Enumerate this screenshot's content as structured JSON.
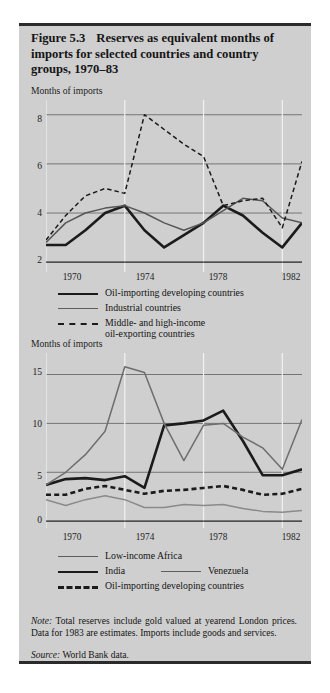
{
  "figure": {
    "number": "Figure 5.3",
    "title": "Reserves as equivalent months of imports for selected countries and country groups, 1970–83",
    "note_label": "Note:",
    "note_text": " Total reserves include gold valued at yearend London prices. Data for 1983 are estimates. Imports include goods and services.",
    "source_label": "Source:",
    "source_text": " World Bank data."
  },
  "chart_data": [
    {
      "id": "panel-top",
      "type": "line",
      "title": "",
      "ylabel": "Months of imports",
      "xlabel": "",
      "x": [
        1970,
        1971,
        1972,
        1973,
        1974,
        1975,
        1976,
        1977,
        1978,
        1979,
        1980,
        1981,
        1982,
        1983
      ],
      "xlim": [
        1970,
        1983
      ],
      "ylim": [
        1.6,
        8.6
      ],
      "yticks": [
        2,
        4,
        6,
        8
      ],
      "ytick_labels": [
        "2",
        "4",
        "6",
        "8"
      ],
      "xticks": [
        1970,
        1974,
        1978,
        1982
      ],
      "xtick_labels": [
        "1970",
        "1974",
        "1978",
        "1982"
      ],
      "grid": "both",
      "legend_position": "below",
      "series": [
        {
          "name": "Oil-importing developing countries",
          "style": "solid",
          "width": "thick",
          "color": "#1b1b1b",
          "values": [
            2.7,
            2.7,
            3.3,
            4.0,
            4.3,
            3.3,
            2.6,
            3.1,
            3.6,
            4.3,
            3.9,
            3.2,
            2.6,
            3.6
          ]
        },
        {
          "name": "Industrial countries",
          "style": "solid",
          "width": "thin",
          "color": "#565656",
          "values": [
            2.8,
            3.6,
            4.0,
            4.2,
            4.3,
            4.0,
            3.6,
            3.3,
            3.6,
            4.1,
            4.6,
            4.5,
            3.8,
            3.6
          ]
        },
        {
          "name": "Middle- and high-income oil-exporting countries",
          "style": "dashed",
          "width": "thin",
          "color": "#1b1b1b",
          "values": [
            2.9,
            3.9,
            4.7,
            5.0,
            4.8,
            8.0,
            7.4,
            6.8,
            6.3,
            4.3,
            4.5,
            4.6,
            3.4,
            6.1
          ]
        }
      ]
    },
    {
      "id": "panel-bottom",
      "type": "line",
      "title": "",
      "ylabel": "Months of imports",
      "xlabel": "",
      "x": [
        1970,
        1971,
        1972,
        1973,
        1974,
        1975,
        1976,
        1977,
        1978,
        1979,
        1980,
        1981,
        1982,
        1983
      ],
      "xlim": [
        1970,
        1983
      ],
      "ylim": [
        -0.7,
        17.2
      ],
      "yticks": [
        0,
        5,
        10,
        15
      ],
      "ytick_labels": [
        "0",
        "5",
        "10",
        "15"
      ],
      "xticks": [
        1970,
        1974,
        1978,
        1982
      ],
      "xtick_labels": [
        "1970",
        "1974",
        "1978",
        "1982"
      ],
      "grid": "both",
      "legend_position": "below",
      "series": [
        {
          "name": "Low-income Africa",
          "style": "solid",
          "width": "thin",
          "color": "#8a8a8a",
          "values": [
            2.2,
            1.6,
            2.2,
            2.6,
            2.2,
            1.4,
            1.4,
            1.7,
            1.6,
            1.7,
            1.3,
            1.0,
            0.9,
            1.1
          ]
        },
        {
          "name": "India",
          "style": "solid",
          "width": "thick",
          "color": "#1b1b1b",
          "values": [
            3.7,
            4.3,
            4.4,
            4.2,
            4.6,
            3.4,
            9.8,
            10.0,
            10.3,
            11.3,
            8.2,
            4.7,
            4.7,
            5.3
          ]
        },
        {
          "name": "Venezuela",
          "style": "solid",
          "width": "thin",
          "color": "#6e6e6e",
          "values": [
            3.7,
            5.0,
            6.8,
            9.2,
            15.8,
            15.2,
            10.0,
            6.2,
            9.8,
            10.0,
            8.6,
            7.5,
            5.3,
            10.4
          ]
        },
        {
          "name": "Oil-importing developing countries",
          "style": "dashed",
          "width": "thick",
          "color": "#1b1b1b",
          "values": [
            2.7,
            2.7,
            3.3,
            3.6,
            3.2,
            2.8,
            3.1,
            3.2,
            3.4,
            3.6,
            3.2,
            2.7,
            2.8,
            3.3
          ]
        }
      ]
    }
  ],
  "panel_top": {
    "ylabel": "Months of imports",
    "yticks": [
      "8",
      "6",
      "4",
      "2"
    ],
    "xticks": [
      "1970",
      "1974",
      "1978",
      "1982"
    ],
    "legend": [
      {
        "label": "Oil-importing developing countries"
      },
      {
        "label": "Industrial countries"
      },
      {
        "label": "Middle- and high-income"
      },
      {
        "label": "oil-exporting countries"
      }
    ]
  },
  "panel_bottom": {
    "ylabel": "Months of imports",
    "yticks": [
      "15",
      "10",
      "5",
      "0"
    ],
    "xticks": [
      "1970",
      "1974",
      "1978",
      "1982"
    ],
    "legend": [
      {
        "label": "Low-income Africa"
      },
      {
        "label": "India"
      },
      {
        "label": "Venezuela"
      },
      {
        "label": "Oil-importing developing countries"
      }
    ]
  }
}
